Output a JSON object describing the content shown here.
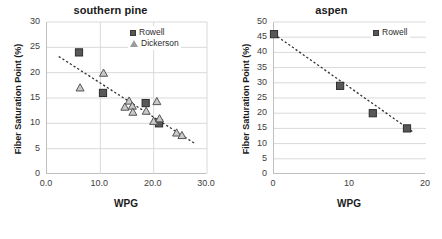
{
  "figure": {
    "panel_count": 2
  },
  "chart_data": [
    {
      "type": "scatter",
      "title": "southern pine",
      "xlabel": "WPG",
      "ylabel": "Fiber Saturation Point (%)",
      "xlim": [
        0,
        30
      ],
      "ylim": [
        0,
        30
      ],
      "xticks": [
        "0.0",
        "10.0",
        "20.0",
        "30.0"
      ],
      "xtick_values": [
        0,
        10,
        20,
        30
      ],
      "yticks": [
        "0",
        "5",
        "10",
        "15",
        "20",
        "25",
        "30"
      ],
      "ytick_values": [
        0,
        5,
        10,
        15,
        20,
        25,
        30
      ],
      "grid": "both",
      "legend_position": "top-right",
      "series": [
        {
          "name": "Rowell",
          "marker": "square",
          "color": "#585858",
          "points": [
            [
              6.0,
              24.0
            ],
            [
              10.5,
              16.0
            ],
            [
              18.5,
              14.0
            ],
            [
              21.0,
              10.0
            ]
          ]
        },
        {
          "name": "Dickerson",
          "marker": "triangle",
          "color": "#8c8c8c",
          "points": [
            [
              6.2,
              17.1
            ],
            [
              10.6,
              20.0
            ],
            [
              14.6,
              13.3
            ],
            [
              15.4,
              14.5
            ],
            [
              16.0,
              13.5
            ],
            [
              16.1,
              12.3
            ],
            [
              18.6,
              12.5
            ],
            [
              20.0,
              10.5
            ],
            [
              20.6,
              14.4
            ],
            [
              21.1,
              11.0
            ],
            [
              24.3,
              8.2
            ],
            [
              25.3,
              7.7
            ]
          ]
        }
      ],
      "trendline": {
        "style": "dashed",
        "color": "#333333",
        "x0": 2.2,
        "y0": 23.2,
        "x1": 27.6,
        "y1": 6.1
      }
    },
    {
      "type": "scatter",
      "title": "aspen",
      "xlabel": "WPG",
      "ylabel": "Fiber Saturation Point (%)",
      "xlim": [
        0,
        20
      ],
      "ylim": [
        0,
        50
      ],
      "xticks": [
        "0",
        "10",
        "20"
      ],
      "xtick_values": [
        0,
        10,
        20
      ],
      "yticks": [
        "0",
        "5",
        "10",
        "15",
        "20",
        "25",
        "30",
        "35",
        "40",
        "45",
        "50"
      ],
      "ytick_values": [
        0,
        5,
        10,
        15,
        20,
        25,
        30,
        35,
        40,
        45,
        50
      ],
      "grid": "y",
      "legend_position": "top-right",
      "series": [
        {
          "name": "Rowell",
          "marker": "square",
          "color": "#585858",
          "points": [
            [
              0.0,
              46.0
            ],
            [
              8.7,
              29.0
            ],
            [
              13.0,
              20.0
            ],
            [
              17.5,
              15.0
            ]
          ]
        }
      ],
      "trendline": {
        "style": "dashed",
        "color": "#333333",
        "x0": 0.0,
        "y0": 46.0,
        "x1": 18.2,
        "y1": 14.0
      }
    }
  ]
}
